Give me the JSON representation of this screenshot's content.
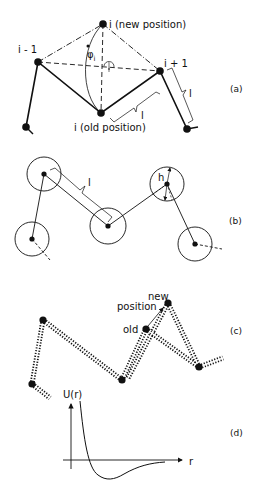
{
  "panels": {
    "a": {
      "tag": "(a)",
      "labels": {
        "new": "i (new position)",
        "prev": "i - 1",
        "next": "i + 1",
        "old": "i (old position)",
        "angle": "φ",
        "angle_sub": "i",
        "bond1": "l",
        "bond2": "l"
      }
    },
    "b": {
      "tag": "(b)",
      "labels": {
        "bond": "l",
        "height": "h"
      }
    },
    "c": {
      "tag": "(c)",
      "labels": {
        "new1": "new",
        "new2": "position",
        "old": "old"
      }
    },
    "d": {
      "tag": "(d)",
      "labels": {
        "yaxis": "U(r)",
        "xaxis": "r"
      }
    }
  }
}
